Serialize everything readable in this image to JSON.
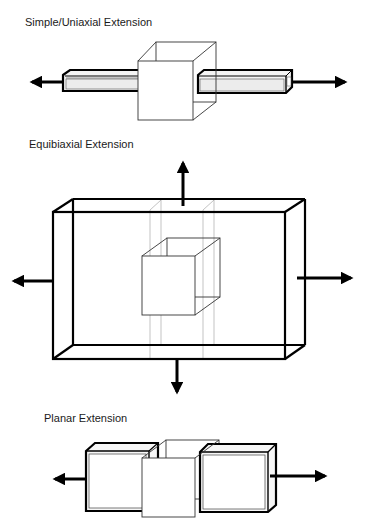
{
  "diagrams": [
    {
      "title": "Simple/Uniaxial Extension",
      "arrows": [
        "left",
        "right"
      ]
    },
    {
      "title": "Equibiaxial Extension",
      "arrows": [
        "up",
        "down",
        "left",
        "right"
      ]
    },
    {
      "title": "Planar Extension",
      "arrows": [
        "left",
        "right"
      ]
    }
  ],
  "colors": {
    "stroke": "#000000",
    "thin_stroke": "#333333",
    "guide_stroke": "#9a9a9a",
    "background": "#ffffff"
  }
}
